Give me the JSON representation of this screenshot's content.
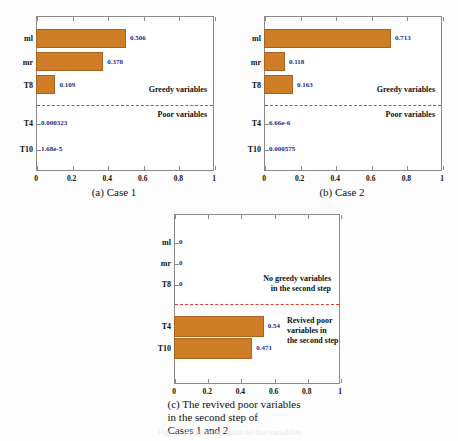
{
  "figure": {
    "bar_color": "#d07d28",
    "value_color": "#1c2a8c",
    "dashline_color": "#e03c2e",
    "bottom_fragment": "Fig. 9. Relative weights of the variables"
  },
  "chart_data": [
    {
      "id": "case1",
      "type": "bar",
      "orientation": "horizontal",
      "title": "",
      "caption": "(a) Case 1",
      "xlabel": "",
      "ylabel": "",
      "xlim": [
        0,
        1
      ],
      "xticks": [
        "0",
        "0.2",
        "0.4",
        "0.6",
        "0.8",
        "1"
      ],
      "xtick_values": [
        0,
        0.2,
        0.4,
        0.6,
        0.8,
        1
      ],
      "grid": false,
      "categories": [
        "ml",
        "mr",
        "T8",
        "T4",
        "T10"
      ],
      "values": [
        0.506,
        0.378,
        0.109,
        0.000323,
        1.68e-05
      ],
      "value_labels": [
        "0.506",
        "0.378",
        "0.109",
        "0.000323",
        "1.68e-5"
      ],
      "annotations": [
        {
          "text": "Greedy variables",
          "position": "above-divider-right"
        },
        {
          "text": "Poor variables",
          "position": "below-divider-right"
        }
      ],
      "divider": {
        "type": "dashed",
        "between": [
          "T8",
          "T4"
        ]
      }
    },
    {
      "id": "case2",
      "type": "bar",
      "orientation": "horizontal",
      "title": "",
      "caption": "(b) Case 2",
      "xlabel": "",
      "ylabel": "",
      "xlim": [
        0,
        1
      ],
      "xticks": [
        "0",
        "0.2",
        "0.4",
        "0.6",
        "0.8",
        "1"
      ],
      "xtick_values": [
        0,
        0.2,
        0.4,
        0.6,
        0.8,
        1
      ],
      "grid": false,
      "categories": [
        "ml",
        "mr",
        "T8",
        "T4",
        "T10"
      ],
      "values": [
        0.713,
        0.118,
        0.163,
        6.66e-06,
        0.000575
      ],
      "value_labels": [
        "0.713",
        "0.118",
        "0.163",
        "6.66e-6",
        "0.000575"
      ],
      "annotations": [
        {
          "text": "Greedy variables",
          "position": "above-divider-right"
        },
        {
          "text": "Poor variables",
          "position": "below-divider-right"
        }
      ],
      "divider": {
        "type": "dashed",
        "between": [
          "T8",
          "T4"
        ]
      }
    },
    {
      "id": "revived",
      "type": "bar",
      "orientation": "horizontal",
      "title": "",
      "caption_lines": [
        "(c) The revived poor variables",
        "in the second step of",
        "Cases 1 and 2"
      ],
      "xlabel": "",
      "ylabel": "",
      "xlim": [
        0,
        1
      ],
      "xticks": [
        "0",
        "0.2",
        "0.4",
        "0.6",
        "0.8",
        "1"
      ],
      "xtick_values": [
        0,
        0.2,
        0.4,
        0.6,
        0.8,
        1
      ],
      "grid": false,
      "categories": [
        "ml",
        "mr",
        "T8",
        "T4",
        "T10"
      ],
      "values": [
        0,
        0,
        0,
        0.54,
        0.471
      ],
      "value_labels": [
        "0",
        "0",
        "0",
        "0.54",
        "0.471"
      ],
      "annotations": [
        {
          "text": "No greedy variables\nin the second step",
          "position": "above-divider-right"
        },
        {
          "text": "Revived poor\nvariables in\nthe second step",
          "position": "below-divider-right"
        }
      ],
      "divider": {
        "type": "dashed",
        "between": [
          "T8",
          "T4"
        ]
      }
    }
  ],
  "panels": {
    "a": {
      "caption": "(a) Case 1",
      "cat_labels": [
        "ml",
        "mr",
        "T8",
        "T4",
        "T10"
      ],
      "value_labels": [
        "0.506",
        "0.378",
        "0.109",
        "0.000323",
        "1.68e-5"
      ],
      "xticks": [
        "0",
        "0.2",
        "0.4",
        "0.6",
        "0.8",
        "1"
      ],
      "annot_top": "Greedy variables",
      "annot_bottom": "Poor variables"
    },
    "b": {
      "caption": "(b) Case 2",
      "cat_labels": [
        "ml",
        "mr",
        "T8",
        "T4",
        "T10"
      ],
      "value_labels": [
        "0.713",
        "0.118",
        "0.163",
        "6.66e-6",
        "0.000575"
      ],
      "xticks": [
        "0",
        "0.2",
        "0.4",
        "0.6",
        "0.8",
        "1"
      ],
      "annot_top": "Greedy variables",
      "annot_bottom": "Poor variables"
    },
    "c": {
      "cat_labels": [
        "ml",
        "mr",
        "T8",
        "T4",
        "T10"
      ],
      "value_labels": [
        "0",
        "0",
        "0",
        "0.54",
        "0.471"
      ],
      "xticks": [
        "0",
        "0.2",
        "0.4",
        "0.6",
        "0.8",
        "1"
      ],
      "annot_top_line1": "No greedy variables",
      "annot_top_line2": "in the second step",
      "annot_bottom_line1": "Revived poor",
      "annot_bottom_line2": "variables in",
      "annot_bottom_line3": "the second step",
      "caption_line1": "(c) The revived poor variables",
      "caption_line2": "in the second step of",
      "caption_line3": "Cases 1 and 2"
    }
  }
}
